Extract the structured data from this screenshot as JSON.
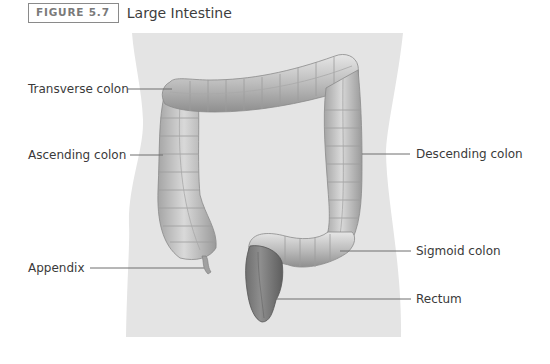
{
  "figure": {
    "number": "FIGURE 5.7",
    "title": "Large Intestine"
  },
  "labels": {
    "transverse": "Transverse colon",
    "ascending": "Ascending colon",
    "appendix": "Appendix",
    "descending": "Descending colon",
    "sigmoid": "Sigmoid colon",
    "rectum": "Rectum"
  },
  "colors": {
    "body_silhouette": "#e4e4e4",
    "colon": "#b8b8b8",
    "leader_line": "#6e6e6e",
    "label_text": "#3a3a3a"
  }
}
